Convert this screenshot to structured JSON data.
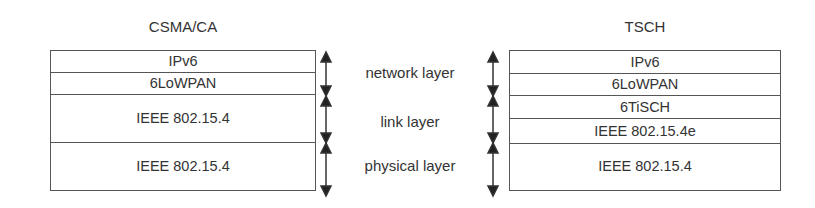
{
  "left": {
    "title": "CSMA/CA",
    "layers": [
      "IPv6",
      "6LoWPAN",
      "IEEE 802.15.4",
      "IEEE 802.15.4"
    ]
  },
  "right": {
    "title": "TSCH",
    "layers": [
      "IPv6",
      "6LoWPAN",
      "6TiSCH",
      "IEEE 802.15.4e",
      "IEEE 802.15.4"
    ]
  },
  "labels": {
    "network": "network layer",
    "link": "link layer",
    "physical": "physical layer"
  },
  "colors": {
    "line": "#555555",
    "arrow": "#222222",
    "text": "#333333"
  }
}
